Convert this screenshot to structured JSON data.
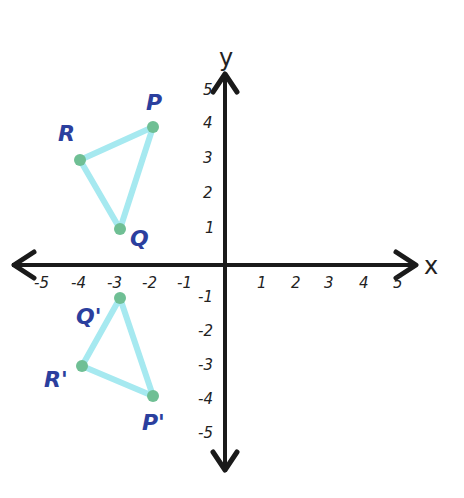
{
  "diagram": {
    "type": "coordinate-plane-reflection",
    "axes": {
      "x_label": "x",
      "y_label": "y",
      "x_ticks": [
        "-5",
        "-4",
        "-3",
        "-2",
        "-1",
        "1",
        "2",
        "3",
        "4",
        "5"
      ],
      "y_ticks": [
        "5",
        "4",
        "3",
        "2",
        "1",
        "-1",
        "-2",
        "-3",
        "-4",
        "-5"
      ],
      "range": [
        -5,
        5
      ]
    },
    "triangles": [
      {
        "name": "PQR",
        "points": [
          {
            "label": "P",
            "x": -2,
            "y": 4
          },
          {
            "label": "Q",
            "x": -3,
            "y": 1
          },
          {
            "label": "R",
            "x": -4,
            "y": 3
          }
        ]
      },
      {
        "name": "P'Q'R'",
        "points": [
          {
            "label": "P'",
            "x": -2,
            "y": -4
          },
          {
            "label": "Q'",
            "x": -3,
            "y": -1
          },
          {
            "label": "R'",
            "x": -4,
            "y": -3
          }
        ]
      }
    ],
    "colors": {
      "axis": "#1a1a1a",
      "triangle_stroke": "#9fe7ee",
      "point_fill": "#6fbf94",
      "label": "#2b3f9e"
    }
  }
}
